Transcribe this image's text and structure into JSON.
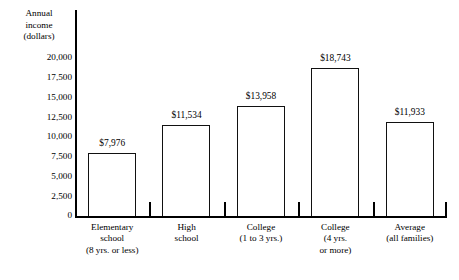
{
  "chart_data": {
    "type": "bar",
    "title": "",
    "xlabel": "",
    "ylabel": "Annual income (dollars)",
    "ylim": [
      0,
      20000
    ],
    "grid": false,
    "legend": false,
    "categories": [
      "Elementary school (8 yrs. or less)",
      "High school",
      "College (1 to 3 yrs.)",
      "College (4 yrs. or more)",
      "Average (all families)"
    ],
    "values": [
      7976,
      11534,
      13958,
      18743,
      11933
    ],
    "value_labels": [
      "$7,976",
      "$11,534",
      "$13,958",
      "$18,743",
      "$11,933"
    ],
    "ytick_values": [
      0,
      2500,
      5000,
      7500,
      10000,
      12500,
      15000,
      17500,
      20000
    ],
    "ytick_labels": [
      "0",
      "2,500",
      "5,000",
      "7,500",
      "10,000",
      "12,500",
      "15,000",
      "17,500",
      "20,000"
    ]
  },
  "axis_title": {
    "line1": "Annual",
    "line2": "income",
    "line3": "(dollars)"
  },
  "category_label_lines": [
    [
      "Elementary",
      "school",
      "(8 yrs. or less)"
    ],
    [
      "High",
      "school"
    ],
    [
      "College",
      "(1 to 3 yrs.)"
    ],
    [
      "College",
      "(4 yrs.",
      "or more)"
    ],
    [
      "Average",
      "(all families)"
    ]
  ],
  "colors": {
    "bar_fill": "#ffffff",
    "bar_stroke": "#111111",
    "axis": "#000000",
    "text": "#000000",
    "background": "#ffffff"
  }
}
